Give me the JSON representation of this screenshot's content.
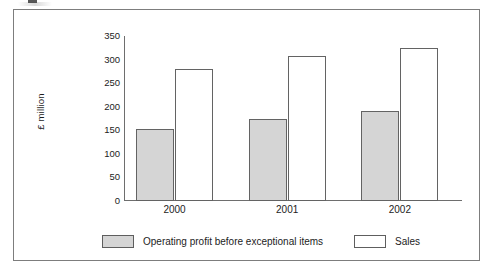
{
  "chart_data": {
    "type": "bar",
    "title": "",
    "subtitle": "",
    "xlabel": "",
    "ylabel": "£ million",
    "categories": [
      "2000",
      "2001",
      "2002"
    ],
    "series": [
      {
        "name": "Operating profit before exceptional items",
        "values": [
          152,
          173,
          190
        ],
        "color": "#d5d5d5"
      },
      {
        "name": "Sales",
        "values": [
          280,
          307,
          325
        ],
        "color": "#ffffff"
      }
    ],
    "ylim": [
      0,
      350
    ],
    "ytick_labels": [
      "0",
      "50",
      "100",
      "150",
      "200",
      "250",
      "300",
      "350"
    ],
    "ytick_values": [
      0,
      50,
      100,
      150,
      200,
      250,
      300,
      350
    ],
    "grid": false,
    "legend_position": "bottom"
  },
  "axes": {
    "y_label": "£ million",
    "ticks": [
      {
        "label": "350",
        "value": 350
      },
      {
        "label": "300",
        "value": 300
      },
      {
        "label": "250",
        "value": 250
      },
      {
        "label": "200",
        "value": 200
      },
      {
        "label": "150",
        "value": 150
      },
      {
        "label": "100",
        "value": 100
      },
      {
        "label": "50",
        "value": 50
      },
      {
        "label": "0",
        "value": 0
      }
    ],
    "x_categories": [
      "2000",
      "2001",
      "2002"
    ]
  },
  "legend": {
    "entries": [
      {
        "label": "Operating profit before exceptional items",
        "swatch": "profit"
      },
      {
        "label": "Sales",
        "swatch": "sales"
      }
    ]
  },
  "colors": {
    "profit_fill": "#d5d5d5",
    "sales_fill": "#ffffff",
    "bar_border": "#636363",
    "axis": "#6e6e6e",
    "frame": "#7d7d7d",
    "text": "#1c1c1c"
  }
}
